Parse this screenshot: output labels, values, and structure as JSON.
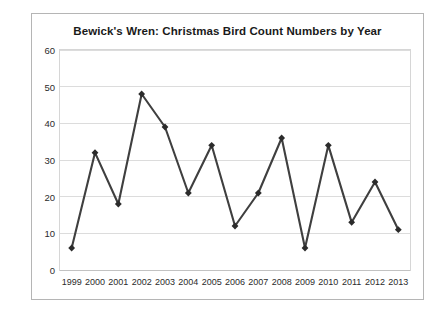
{
  "chart_data": {
    "type": "line",
    "title": "Bewick's Wren: Christmas Bird Count Numbers by Year",
    "xlabel": "",
    "ylabel": "",
    "categories": [
      "1999",
      "2000",
      "2001",
      "2002",
      "2003",
      "2004",
      "2005",
      "2006",
      "2007",
      "2008",
      "2009",
      "2010",
      "2011",
      "2012",
      "2013"
    ],
    "series": [
      {
        "name": "Bewick's Wren count",
        "values": [
          6,
          32,
          18,
          48,
          39,
          21,
          34,
          12,
          21,
          36,
          6,
          34,
          13,
          24,
          11
        ]
      }
    ],
    "ylim": [
      0,
      60
    ],
    "yticks": [
      0,
      10,
      20,
      30,
      40,
      50,
      60
    ],
    "ytick_labels": [
      "0",
      "10",
      "20",
      "30",
      "40",
      "50",
      "60"
    ],
    "grid": "horizontal",
    "legend": "none",
    "marker": "diamond",
    "line_color": "#3f3f3f",
    "marker_color": "#2b2b2b",
    "gridline_color": "#dcdcdc",
    "border_color": "#b5b5b5",
    "background_color": "#ffffff"
  }
}
